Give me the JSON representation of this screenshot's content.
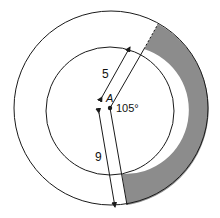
{
  "diagram": {
    "type": "annulus-sector",
    "center_label": "A",
    "inner_radius_label": "5",
    "outer_radius_label": "9",
    "angle_label": "105°",
    "colors": {
      "shaded": "#8c8c8c",
      "stroke": "#1a1a1a",
      "background": "#ffffff"
    }
  }
}
